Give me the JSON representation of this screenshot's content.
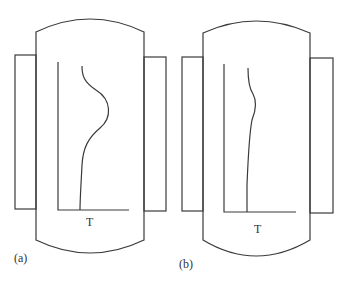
{
  "figure": {
    "panels": [
      {
        "id": "a",
        "caption": "(a)",
        "axis_label": "T",
        "profile": "pronounced bulge toward higher T in upper-middle region"
      },
      {
        "id": "b",
        "caption": "(b)",
        "axis_label": "T",
        "profile": "slight bulge, nearly uniform"
      }
    ],
    "colors": {
      "line": "#3a3a3a",
      "background": "#ffffff"
    }
  }
}
